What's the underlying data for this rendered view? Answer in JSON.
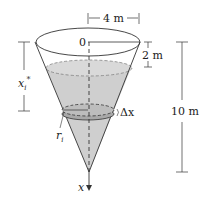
{
  "diagram": {
    "type": "inverted-cone-tank",
    "labels": {
      "top_radius": "4 m",
      "origin": "0",
      "empty_depth": "2 m",
      "height": "10 m",
      "depth_var": "x",
      "depth_sub": "i",
      "depth_star": "*",
      "slice_thickness": "Δx",
      "radius_var": "r",
      "radius_sub": "i",
      "axis": "x"
    },
    "colors": {
      "water": "#c8c8c8",
      "slice": "#a8a8a8",
      "outline": "#333333"
    }
  }
}
